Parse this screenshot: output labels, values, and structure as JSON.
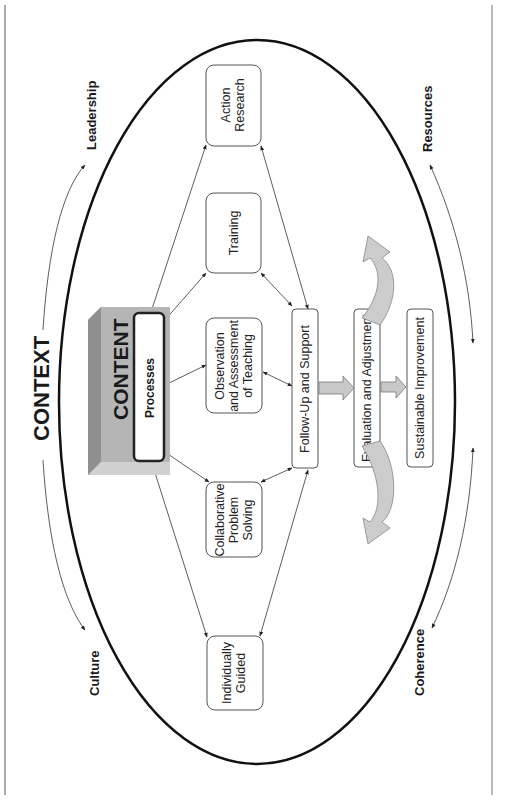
{
  "diagram": {
    "orientation": "rotated-90-ccw",
    "outer_label": "CONTEXT",
    "corner_labels": {
      "top_left": "Leadership",
      "top_right": "Resources",
      "bottom_left": "Culture",
      "bottom_right": "Coherence"
    },
    "center_block": {
      "title": "CONTENT",
      "subtitle": "Processes"
    },
    "models": [
      {
        "id": "action-research",
        "lines": [
          "Action",
          "Research"
        ]
      },
      {
        "id": "training",
        "lines": [
          "Training"
        ]
      },
      {
        "id": "observation",
        "lines": [
          "Observation",
          "and Assessment",
          "of Teaching"
        ]
      },
      {
        "id": "collaborative",
        "lines": [
          "Collaborative",
          "Problem",
          "Solving"
        ]
      },
      {
        "id": "individually-guided",
        "lines": [
          "Individually",
          "Guided"
        ]
      }
    ],
    "flow": {
      "step1": "Follow-Up and Support",
      "step2": "Evaluation and Adjustment",
      "step3": "Sustainable Improvement"
    },
    "colors": {
      "ellipse": "#111111",
      "content_block": "#b5b5b5",
      "content_block_dark": "#8f8f8f",
      "block_arrow": "#c8c8c8",
      "curved_arrow": "#cccccc"
    }
  }
}
